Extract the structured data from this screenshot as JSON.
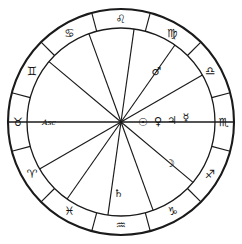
{
  "chart_data": {
    "type": "wheel",
    "geometry": {
      "center_x": 121,
      "center_y": 122,
      "outer_radius": 113,
      "inner_radius": 94,
      "sign_ring_width": 19,
      "house_count": 12,
      "sign_count": 12
    },
    "colors": {
      "stroke": "#1a1a1a",
      "glyph": "#141414",
      "background": "#ffffff"
    },
    "signs": [
      {
        "name": "Scorpio",
        "glyph": "♏",
        "angle_deg": 0,
        "label_radius": 103
      },
      {
        "name": "Libra",
        "glyph": "♎",
        "angle_deg": 30,
        "label_radius": 103
      },
      {
        "name": "Virgo",
        "glyph": "♍",
        "angle_deg": 60,
        "label_radius": 103
      },
      {
        "name": "Leo",
        "glyph": "♌",
        "angle_deg": 90,
        "label_radius": 103
      },
      {
        "name": "Cancer",
        "glyph": "♋",
        "angle_deg": 120,
        "label_radius": 103
      },
      {
        "name": "Gemini",
        "glyph": "♊",
        "angle_deg": 150,
        "label_radius": 103
      },
      {
        "name": "Taurus",
        "glyph": "♉",
        "angle_deg": 180,
        "label_radius": 103
      },
      {
        "name": "Aries",
        "glyph": "♈",
        "angle_deg": 210,
        "label_radius": 103
      },
      {
        "name": "Pisces",
        "glyph": "♓",
        "angle_deg": 240,
        "label_radius": 103
      },
      {
        "name": "Aquarius",
        "glyph": "♒",
        "angle_deg": 270,
        "label_radius": 103
      },
      {
        "name": "Capricorn",
        "glyph": "♑",
        "angle_deg": 300,
        "label_radius": 103
      },
      {
        "name": "Sagittarius",
        "glyph": "♐",
        "angle_deg": 330,
        "label_radius": 103
      }
    ],
    "planets": [
      {
        "name": "Mercury",
        "glyph": "☿",
        "angle_deg": 4,
        "radius": 65
      },
      {
        "name": "Jupiter",
        "glyph": "♃",
        "angle_deg": 2,
        "radius": 51
      },
      {
        "name": "Venus",
        "glyph": "♀",
        "angle_deg": 1,
        "radius": 37
      },
      {
        "name": "Sun",
        "glyph": "☉",
        "angle_deg": 0,
        "radius": 22
      },
      {
        "name": "Moon",
        "glyph": "☽",
        "angle_deg": 320,
        "radius": 64
      },
      {
        "name": "Saturn",
        "glyph": "♄",
        "angle_deg": 268,
        "radius": 72
      },
      {
        "name": "Mars",
        "glyph": "♂",
        "angle_deg": 55,
        "radius": 62
      }
    ],
    "points": [
      {
        "name": "Ascendant",
        "label": "Asc",
        "angle_deg": 180,
        "radius": 72
      }
    ],
    "house_spokes_deg": [
      0,
      30,
      55,
      82,
      110,
      140,
      180,
      210,
      235,
      262,
      290,
      320
    ],
    "axis_spokes_deg": [
      0,
      180
    ],
    "sign_dividers_deg": [
      15,
      45,
      75,
      105,
      135,
      165,
      195,
      225,
      255,
      285,
      315,
      345
    ]
  }
}
